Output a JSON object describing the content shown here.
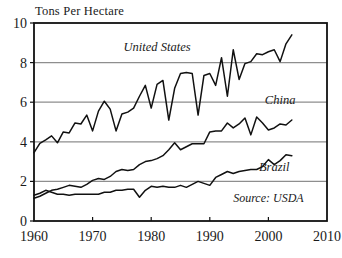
{
  "chart_data": {
    "type": "line",
    "title": "Tons Per Hectare",
    "xlabel": "",
    "ylabel": "Tons Per Hectare",
    "xlim": [
      1960,
      2010
    ],
    "ylim": [
      0,
      10
    ],
    "xticks": [
      1960,
      1970,
      1980,
      1990,
      2000,
      2010
    ],
    "yticks": [
      0,
      2,
      4,
      6,
      8,
      10
    ],
    "grid": "horizontal",
    "gridlines_at": [
      2,
      4,
      6,
      8
    ],
    "legend_position": "inline-annotations",
    "annotations": [
      {
        "text": "United States",
        "x": 1981,
        "y": 8.6
      },
      {
        "text": "China",
        "x": 2002,
        "y": 5.9
      },
      {
        "text": "Brazil",
        "x": 2001,
        "y": 2.55
      },
      {
        "text": "Source: USDA",
        "x": 2000,
        "y": 0.95
      }
    ],
    "x": [
      1960,
      1961,
      1962,
      1963,
      1964,
      1965,
      1966,
      1967,
      1968,
      1969,
      1970,
      1971,
      1972,
      1973,
      1974,
      1975,
      1976,
      1977,
      1978,
      1979,
      1980,
      1981,
      1982,
      1983,
      1984,
      1985,
      1986,
      1987,
      1988,
      1989,
      1990,
      1991,
      1992,
      1993,
      1994,
      1995,
      1996,
      1997,
      1998,
      1999,
      2000,
      2001,
      2002,
      2003,
      2004
    ],
    "series": [
      {
        "name": "United States",
        "color": "#111111",
        "values": [
          3.45,
          3.92,
          4.1,
          4.3,
          3.95,
          4.5,
          4.45,
          4.95,
          4.9,
          5.35,
          4.55,
          5.55,
          6.05,
          5.65,
          4.55,
          5.4,
          5.5,
          5.7,
          6.3,
          6.85,
          5.7,
          6.9,
          7.1,
          5.1,
          6.7,
          7.45,
          7.5,
          7.45,
          5.35,
          7.35,
          7.45,
          6.85,
          8.25,
          6.3,
          8.65,
          7.15,
          7.95,
          8.05,
          8.45,
          8.4,
          8.55,
          8.65,
          8.05,
          8.95,
          9.4
        ]
      },
      {
        "name": "China",
        "color": "#111111",
        "values": [
          1.15,
          1.25,
          1.4,
          1.55,
          1.6,
          1.7,
          1.8,
          1.75,
          1.7,
          1.85,
          2.05,
          2.15,
          2.1,
          2.25,
          2.5,
          2.6,
          2.55,
          2.6,
          2.85,
          3.0,
          3.05,
          3.15,
          3.3,
          3.6,
          3.95,
          3.6,
          3.75,
          3.9,
          3.9,
          3.9,
          4.5,
          4.55,
          4.55,
          4.95,
          4.7,
          4.9,
          5.2,
          4.35,
          5.25,
          4.95,
          4.6,
          4.7,
          4.9,
          4.85,
          5.1
        ]
      },
      {
        "name": "Brazil",
        "color": "#111111",
        "values": [
          1.3,
          1.4,
          1.55,
          1.45,
          1.35,
          1.35,
          1.3,
          1.35,
          1.35,
          1.35,
          1.35,
          1.35,
          1.45,
          1.45,
          1.55,
          1.55,
          1.6,
          1.6,
          1.2,
          1.55,
          1.75,
          1.7,
          1.75,
          1.7,
          1.7,
          1.8,
          1.7,
          1.85,
          2.0,
          1.9,
          1.8,
          2.2,
          2.35,
          2.5,
          2.4,
          2.5,
          2.55,
          2.6,
          2.6,
          2.75,
          3.1,
          2.85,
          3.05,
          3.35,
          3.3
        ]
      }
    ]
  }
}
